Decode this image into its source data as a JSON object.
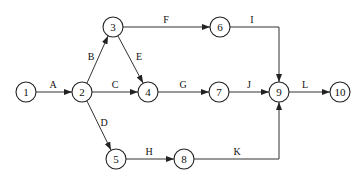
{
  "diagram": {
    "type": "activity-on-arrow network",
    "node_radius": 10,
    "nodes": [
      {
        "id": "1",
        "label": "1",
        "x": 26,
        "y": 92
      },
      {
        "id": "2",
        "label": "2",
        "x": 82,
        "y": 92
      },
      {
        "id": "3",
        "label": "3",
        "x": 113,
        "y": 27
      },
      {
        "id": "4",
        "label": "4",
        "x": 148,
        "y": 92
      },
      {
        "id": "5",
        "label": "5",
        "x": 116,
        "y": 159
      },
      {
        "id": "6",
        "label": "6",
        "x": 220,
        "y": 27
      },
      {
        "id": "7",
        "label": "7",
        "x": 219,
        "y": 92
      },
      {
        "id": "8",
        "label": "8",
        "x": 184,
        "y": 159
      },
      {
        "id": "9",
        "label": "9",
        "x": 279,
        "y": 92
      },
      {
        "id": "10",
        "label": "10",
        "x": 340,
        "y": 92
      }
    ],
    "edges": [
      {
        "from": "1",
        "to": "2",
        "label": "A"
      },
      {
        "from": "2",
        "to": "3",
        "label": "B"
      },
      {
        "from": "2",
        "to": "4",
        "label": "C"
      },
      {
        "from": "2",
        "to": "5",
        "label": "D"
      },
      {
        "from": "3",
        "to": "4",
        "label": "E"
      },
      {
        "from": "3",
        "to": "6",
        "label": "F"
      },
      {
        "from": "4",
        "to": "7",
        "label": "G"
      },
      {
        "from": "5",
        "to": "8",
        "label": "H"
      },
      {
        "from": "6",
        "to": "9",
        "label": "I"
      },
      {
        "from": "7",
        "to": "9",
        "label": "J"
      },
      {
        "from": "8",
        "to": "9",
        "label": "K"
      },
      {
        "from": "9",
        "to": "10",
        "label": "L"
      }
    ]
  }
}
